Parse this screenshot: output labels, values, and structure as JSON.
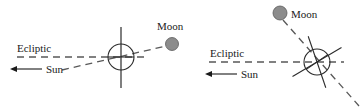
{
  "figure": {
    "width": 364,
    "height": 111,
    "background_color": "#ffffff",
    "panels": [
      {
        "id": "left-panel",
        "name": "earth-moon-ecliptic-upright",
        "labels": {
          "ecliptic": "Ecliptic",
          "sun": "Sun",
          "moon": "Moon"
        },
        "earth": {
          "center_x": 121,
          "center_y": 57,
          "radius": 13,
          "axis_tilt_deg": 0,
          "axis_top_y": 27,
          "axis_bottom_y": 88
        },
        "moon": {
          "center_x": 172,
          "center_y": 44,
          "radius": 6.5,
          "fill_color": "#8c8c8c"
        },
        "ecliptic": {
          "x1": 17,
          "y1": 57,
          "x2": 148,
          "y2": 57,
          "dashed": true,
          "color": "#585858"
        },
        "moon_orbit": {
          "x1": 62,
          "y1": 70,
          "x2": 166,
          "y2": 46,
          "dashed": true,
          "color": "#585858"
        },
        "sun_arrow": {
          "tail_x": 42,
          "tail_y": 69,
          "head_x": 12,
          "head_y": 69,
          "direction": "left"
        }
      },
      {
        "id": "right-panel",
        "name": "earth-moon-ecliptic-tilted",
        "labels": {
          "ecliptic": "Ecliptic",
          "sun": "Sun",
          "moon": "Moon"
        },
        "earth": {
          "center_x": 317,
          "center_y": 62,
          "radius": 13,
          "axis_tilt_deg": 28,
          "ray_count": 4
        },
        "moon": {
          "center_x": 280,
          "center_y": 13,
          "radius": 7,
          "fill_color": "#8c8c8c"
        },
        "ecliptic": {
          "x1": 209,
          "y1": 62,
          "x2": 344,
          "y2": 62,
          "dashed": true,
          "color": "#585858"
        },
        "moon_orbit": {
          "x1": 283,
          "y1": 20,
          "x2": 359,
          "y2": 106,
          "dashed": true,
          "color": "#585858"
        },
        "sun_arrow": {
          "tail_x": 237,
          "tail_y": 74,
          "head_x": 207,
          "head_y": 74,
          "direction": "left"
        }
      }
    ],
    "colors": {
      "stroke": "#2b2b2b",
      "dashed_stroke": "#585858",
      "moon_fill": "#8c8c8c",
      "text": "#1a1a1a"
    }
  }
}
